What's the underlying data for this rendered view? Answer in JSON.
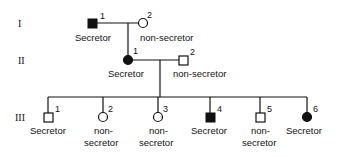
{
  "diagram": {
    "type": "pedigree",
    "generations": [
      {
        "label": "I",
        "y": 23
      },
      {
        "label": "II",
        "y": 60
      },
      {
        "label": "III",
        "y": 117
      }
    ],
    "individuals": {
      "I_1": {
        "number": "1",
        "sex": "male",
        "affected": true,
        "label": "Secretor"
      },
      "I_2": {
        "number": "2",
        "sex": "female",
        "affected": false,
        "label": "non-secretor"
      },
      "II_1": {
        "number": "1",
        "sex": "female",
        "affected": true,
        "label": "Secretor"
      },
      "II_2": {
        "number": "2",
        "sex": "male",
        "affected": false,
        "label": "non-secretor"
      },
      "III_1": {
        "number": "1",
        "sex": "male",
        "affected": false,
        "label": "Secretor"
      },
      "III_2": {
        "number": "2",
        "sex": "female",
        "affected": false,
        "label_line1": "non-",
        "label_line2": "secretor"
      },
      "III_3": {
        "number": "3",
        "sex": "female",
        "affected": false,
        "label_line1": "non-",
        "label_line2": "secretor"
      },
      "III_4": {
        "number": "4",
        "sex": "male",
        "affected": true,
        "label": "Secretor"
      },
      "III_5": {
        "number": "5",
        "sex": "male",
        "affected": false,
        "label_line1": "non-",
        "label_line2": "secretor"
      },
      "III_6": {
        "number": "6",
        "sex": "female",
        "affected": true,
        "label": "Secretor"
      }
    },
    "colors": {
      "affected": "#111111",
      "unaffected": "#ffffff",
      "line": "#111111"
    }
  }
}
